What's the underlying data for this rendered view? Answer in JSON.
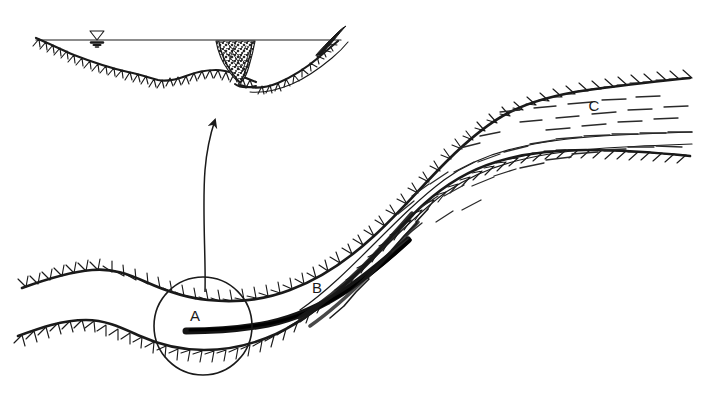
{
  "figure": {
    "background_color": "#ffffff",
    "ink_color": "#1a1a1a",
    "width": 713,
    "height": 400
  },
  "labels": {
    "a": "A",
    "b": "B",
    "c": "C"
  },
  "annotations": {
    "callout_arrow_name": "callout-arrow",
    "detail_circle_name": "detail-circle-a",
    "water_level_symbol": "water-level-triangle"
  },
  "inset": {
    "name": "channel-cross-section",
    "features": [
      "water-surface-line",
      "water-level-symbol",
      "valley-floor-hachured",
      "sediment-plug-stipple",
      "right-bank-levee"
    ]
  },
  "plan_view": {
    "name": "channel-plan-view",
    "features": [
      "upper-bank-hachured",
      "lower-bank-hachured",
      "flow-dashes",
      "dark-sediment-streak"
    ]
  }
}
